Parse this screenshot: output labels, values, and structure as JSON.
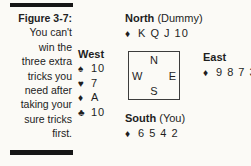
{
  "figure": {
    "label": "Figure 3-7:",
    "caption_lines": [
      "You can't",
      "win the",
      "three extra",
      "tricks you",
      "need after",
      "taking your",
      "sure tricks",
      "first."
    ]
  },
  "diagram": {
    "north": {
      "name": "North",
      "role": "(Dummy)",
      "cards": [
        {
          "suit": "diamond",
          "symbol": "♦",
          "values": "K Q J 10"
        }
      ]
    },
    "west": {
      "name": "West",
      "cards": [
        {
          "suit": "spade",
          "symbol": "♠",
          "values": "10"
        },
        {
          "suit": "heart",
          "symbol": "♥",
          "values": "7"
        },
        {
          "suit": "diamond",
          "symbol": "♦",
          "values": "A"
        },
        {
          "suit": "club",
          "symbol": "♣",
          "values": "10"
        }
      ]
    },
    "east": {
      "name": "East",
      "cards": [
        {
          "suit": "diamond",
          "symbol": "♦",
          "values": "9 8 7 3"
        }
      ]
    },
    "south": {
      "name": "South",
      "role": "(You)",
      "cards": [
        {
          "suit": "diamond",
          "symbol": "♦",
          "values": "6 5 4 2"
        }
      ]
    },
    "compass": {
      "north": "N",
      "west": "W",
      "east": "E",
      "south": "S"
    }
  },
  "colors": {
    "background": "#fbfaf6",
    "text": "#1e1e1e",
    "rule": "#161616"
  }
}
